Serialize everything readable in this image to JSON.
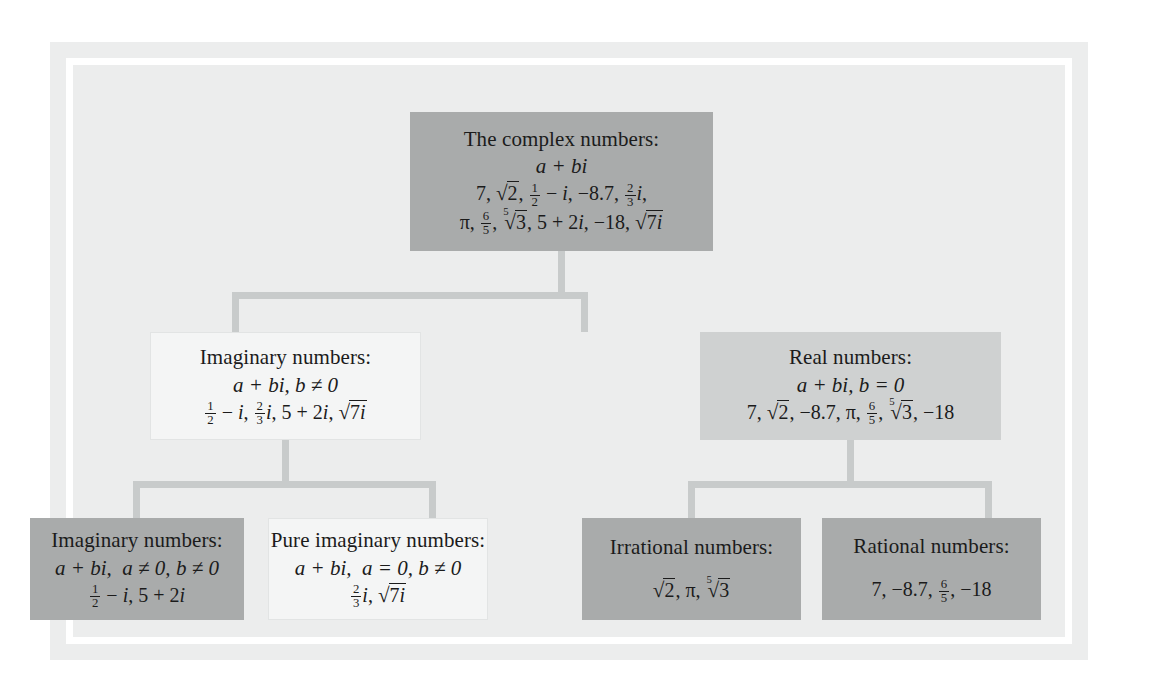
{
  "diagram": {
    "colors": {
      "panel_background": "#eceded",
      "frame_ring": "#ffffff",
      "connector": "#c8cbcb",
      "tone_dark": "#a9abab",
      "tone_mid": "#cfd1d1",
      "tone_light": "#f4f5f5",
      "text": "#1b1b1b"
    },
    "nodes": {
      "complex": {
        "title": "The complex numbers:",
        "form": "a + bi",
        "items_line1": "7, √2, 1/2 − i, −8.7, 2/3 i,",
        "items_line2": "π, 6/5, ⁵√3, 5 + 2i, −18, √7i"
      },
      "imaginary": {
        "title": "Imaginary numbers:",
        "form": "a + bi, b ≠ 0",
        "items": "1/2 − i, 2/3 i, 5 + 2i, √7i"
      },
      "real": {
        "title": "Real numbers:",
        "form": "a + bi, b = 0",
        "items": "7, √2, −8.7, π, 6/5, ⁵√3, −18"
      },
      "imaginary_leaf": {
        "title": "Imaginary numbers:",
        "form": "a + bi,  a ≠ 0, b ≠ 0",
        "items": "1/2 − i, 5 + 2i"
      },
      "pure_imaginary": {
        "title": "Pure imaginary numbers:",
        "form": "a + bi,  a = 0, b ≠ 0",
        "items": "2/3 i, √7i"
      },
      "irrational": {
        "title": "Irrational numbers:",
        "items": "√2, π, ⁵√3"
      },
      "rational": {
        "title": "Rational numbers:",
        "items": "7, −8.7, 6/5, −18"
      }
    }
  }
}
